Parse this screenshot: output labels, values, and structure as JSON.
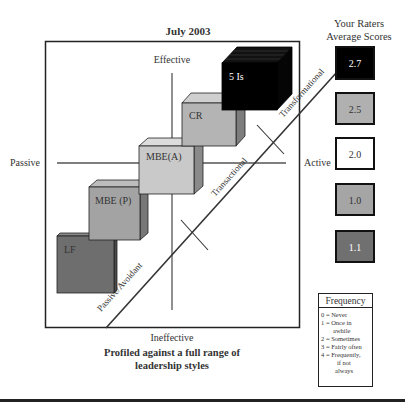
{
  "header": {
    "date_title": "July 2003",
    "scores_title_line1": "Your Raters",
    "scores_title_line2": "Average Scores"
  },
  "axes": {
    "top": "Effective",
    "bottom": "Ineffective",
    "left": "Passive",
    "right": "Active"
  },
  "diagonal_labels": {
    "transformational": "Transformational",
    "transactional": "Transactional",
    "passive_avoidant": "Passive/Avoidant"
  },
  "cubes": [
    {
      "label": "LF",
      "color": "#6e6e6e"
    },
    {
      "label": "MBE (P)",
      "color": "#a3a3a3"
    },
    {
      "label": "MBE(A)",
      "color": "#c9c9c9"
    },
    {
      "label": "CR",
      "color": "#b4b4b4"
    },
    {
      "label": "5 Is",
      "color": "#000000"
    }
  ],
  "scores": [
    {
      "value": "2.7",
      "fill": "#000000",
      "text_color": "#ffffff"
    },
    {
      "value": "2.5",
      "fill": "#b0b0b0",
      "text_color": "#222222"
    },
    {
      "value": "2.0",
      "fill": "#ffffff",
      "text_color": "#222222"
    },
    {
      "value": "1.0",
      "fill": "#a5a5a5",
      "text_color": "#222222"
    },
    {
      "value": "1.1",
      "fill": "#707070",
      "text_color": "#ffffff"
    }
  ],
  "frequency": {
    "title": "Frequency",
    "lines": [
      "0 = Never",
      "1 = Once in",
      "awhile",
      "2 = Sometimes",
      "3 = Fairly often",
      "4 = Frequently,",
      "if not",
      "always"
    ]
  },
  "caption": {
    "line1": "Profiled against a full range of",
    "line2": "leadership styles"
  }
}
